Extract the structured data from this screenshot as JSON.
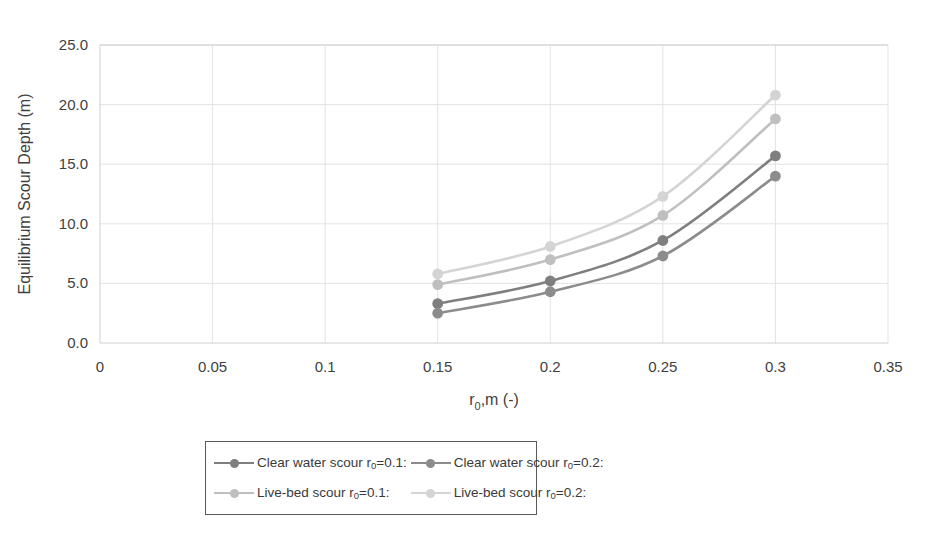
{
  "chart_data": {
    "type": "line",
    "title": "",
    "xlabel": "r0,m (-)",
    "ylabel": "Equilibrium Scour Depth (m)",
    "x": [
      0.15,
      0.2,
      0.25,
      0.3
    ],
    "xlim": [
      0,
      0.35
    ],
    "ylim": [
      0,
      25
    ],
    "xticks": [
      "0",
      "0.05",
      "0.1",
      "0.15",
      "0.2",
      "0.25",
      "0.3",
      "0.35"
    ],
    "xtick_values": [
      0,
      0.05,
      0.1,
      0.15,
      0.2,
      0.25,
      0.3,
      0.35
    ],
    "yticks": [
      "0.0",
      "5.0",
      "10.0",
      "15.0",
      "20.0",
      "25.0"
    ],
    "ytick_values": [
      0,
      5,
      10,
      15,
      20,
      25
    ],
    "grid": true,
    "grid_axis": "both",
    "legend_position": "bottom",
    "markers": "circle",
    "series": [
      {
        "name": "Clear water scour r0=0.1:",
        "label_main": "Clear water scour r",
        "label_sub": "0",
        "label_tail": "=0.1:",
        "color": "#7f7f7f",
        "values": [
          3.3,
          5.2,
          8.6,
          15.7
        ]
      },
      {
        "name": "Clear water scour r0=0.2:",
        "label_main": "Clear water scour r",
        "label_sub": "0",
        "label_tail": "=0.2:",
        "color": "#8c8c8c",
        "values": [
          2.5,
          4.3,
          7.3,
          14.0
        ]
      },
      {
        "name": "Live-bed scour r0=0.1:",
        "label_main": "Live-bed scour r",
        "label_sub": "0",
        "label_tail": "=0.1:",
        "color": "#bfbfbf",
        "values": [
          4.9,
          7.0,
          10.7,
          18.8
        ]
      },
      {
        "name": "Live-bed scour r0=0.2:",
        "label_main": "Live-bed scour r",
        "label_sub": "0",
        "label_tail": "=0.2:",
        "color": "#d4d4d4",
        "values": [
          5.8,
          8.1,
          12.3,
          20.8
        ]
      }
    ]
  },
  "axis": {
    "xtitle_main": "r",
    "xtitle_sub": "0",
    "xtitle_tail": ",m (-)",
    "ytitle": "Equilibrium Scour Depth (m)"
  },
  "colors": {
    "grid": "#e3e3e3",
    "axis": "#cfcfcf",
    "text": "#3f3f3f",
    "legend_border": "#5a5a5a"
  }
}
